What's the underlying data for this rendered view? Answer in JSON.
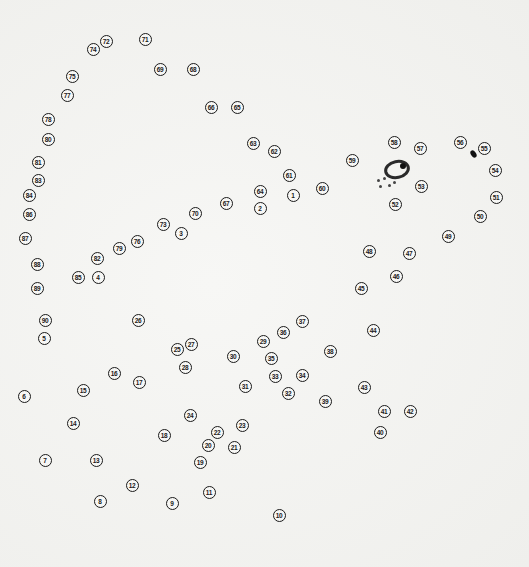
{
  "puzzle": {
    "type": "dot-to-dot",
    "dot_count": 90,
    "line_color": "#1a1a1a",
    "dots": [
      {
        "n": "1",
        "x": 293,
        "y": 195
      },
      {
        "n": "2",
        "x": 260,
        "y": 208
      },
      {
        "n": "3",
        "x": 181,
        "y": 233
      },
      {
        "n": "4",
        "x": 98,
        "y": 277
      },
      {
        "n": "5",
        "x": 44,
        "y": 338
      },
      {
        "n": "6",
        "x": 24,
        "y": 396
      },
      {
        "n": "7",
        "x": 45,
        "y": 460
      },
      {
        "n": "8",
        "x": 100,
        "y": 501
      },
      {
        "n": "9",
        "x": 172,
        "y": 503
      },
      {
        "n": "10",
        "x": 279,
        "y": 515
      },
      {
        "n": "11",
        "x": 209,
        "y": 492
      },
      {
        "n": "12",
        "x": 132,
        "y": 485
      },
      {
        "n": "13",
        "x": 96,
        "y": 460
      },
      {
        "n": "14",
        "x": 73,
        "y": 423
      },
      {
        "n": "15",
        "x": 83,
        "y": 390
      },
      {
        "n": "16",
        "x": 114,
        "y": 373
      },
      {
        "n": "17",
        "x": 139,
        "y": 382
      },
      {
        "n": "18",
        "x": 164,
        "y": 435
      },
      {
        "n": "19",
        "x": 200,
        "y": 462
      },
      {
        "n": "20",
        "x": 208,
        "y": 445
      },
      {
        "n": "21",
        "x": 234,
        "y": 447
      },
      {
        "n": "22",
        "x": 217,
        "y": 432
      },
      {
        "n": "23",
        "x": 242,
        "y": 425
      },
      {
        "n": "24",
        "x": 190,
        "y": 415
      },
      {
        "n": "25",
        "x": 177,
        "y": 349
      },
      {
        "n": "26",
        "x": 138,
        "y": 320
      },
      {
        "n": "27",
        "x": 191,
        "y": 344
      },
      {
        "n": "28",
        "x": 185,
        "y": 367
      },
      {
        "n": "29",
        "x": 263,
        "y": 341
      },
      {
        "n": "30",
        "x": 233,
        "y": 356
      },
      {
        "n": "31",
        "x": 245,
        "y": 386
      },
      {
        "n": "32",
        "x": 288,
        "y": 393
      },
      {
        "n": "33",
        "x": 275,
        "y": 376
      },
      {
        "n": "34",
        "x": 302,
        "y": 375
      },
      {
        "n": "35",
        "x": 271,
        "y": 358
      },
      {
        "n": "36",
        "x": 283,
        "y": 332
      },
      {
        "n": "37",
        "x": 302,
        "y": 321
      },
      {
        "n": "38",
        "x": 330,
        "y": 351
      },
      {
        "n": "39",
        "x": 325,
        "y": 401
      },
      {
        "n": "40",
        "x": 380,
        "y": 432
      },
      {
        "n": "41",
        "x": 384,
        "y": 411
      },
      {
        "n": "42",
        "x": 410,
        "y": 411
      },
      {
        "n": "43",
        "x": 364,
        "y": 387
      },
      {
        "n": "44",
        "x": 373,
        "y": 330
      },
      {
        "n": "45",
        "x": 361,
        "y": 288
      },
      {
        "n": "46",
        "x": 396,
        "y": 276
      },
      {
        "n": "47",
        "x": 409,
        "y": 253
      },
      {
        "n": "48",
        "x": 369,
        "y": 251
      },
      {
        "n": "49",
        "x": 448,
        "y": 236
      },
      {
        "n": "50",
        "x": 480,
        "y": 216
      },
      {
        "n": "51",
        "x": 496,
        "y": 197
      },
      {
        "n": "52",
        "x": 395,
        "y": 204
      },
      {
        "n": "53",
        "x": 421,
        "y": 186
      },
      {
        "n": "54",
        "x": 495,
        "y": 170
      },
      {
        "n": "55",
        "x": 484,
        "y": 148
      },
      {
        "n": "56",
        "x": 460,
        "y": 142
      },
      {
        "n": "57",
        "x": 420,
        "y": 148
      },
      {
        "n": "58",
        "x": 394,
        "y": 142
      },
      {
        "n": "59",
        "x": 352,
        "y": 160
      },
      {
        "n": "60",
        "x": 322,
        "y": 188
      },
      {
        "n": "61",
        "x": 289,
        "y": 175
      },
      {
        "n": "62",
        "x": 274,
        "y": 151
      },
      {
        "n": "63",
        "x": 253,
        "y": 143
      },
      {
        "n": "64",
        "x": 260,
        "y": 191
      },
      {
        "n": "65",
        "x": 237,
        "y": 107
      },
      {
        "n": "66",
        "x": 211,
        "y": 107
      },
      {
        "n": "67",
        "x": 226,
        "y": 203
      },
      {
        "n": "68",
        "x": 193,
        "y": 69
      },
      {
        "n": "69",
        "x": 160,
        "y": 69
      },
      {
        "n": "70",
        "x": 195,
        "y": 213
      },
      {
        "n": "71",
        "x": 145,
        "y": 39
      },
      {
        "n": "72",
        "x": 106,
        "y": 41
      },
      {
        "n": "73",
        "x": 163,
        "y": 224
      },
      {
        "n": "74",
        "x": 93,
        "y": 49
      },
      {
        "n": "75",
        "x": 72,
        "y": 76
      },
      {
        "n": "76",
        "x": 137,
        "y": 241
      },
      {
        "n": "77",
        "x": 67,
        "y": 95
      },
      {
        "n": "78",
        "x": 48,
        "y": 119
      },
      {
        "n": "79",
        "x": 119,
        "y": 248
      },
      {
        "n": "80",
        "x": 48,
        "y": 139
      },
      {
        "n": "81",
        "x": 38,
        "y": 162
      },
      {
        "n": "82",
        "x": 97,
        "y": 258
      },
      {
        "n": "83",
        "x": 38,
        "y": 180
      },
      {
        "n": "84",
        "x": 29,
        "y": 195
      },
      {
        "n": "85",
        "x": 78,
        "y": 277
      },
      {
        "n": "86",
        "x": 29,
        "y": 214
      },
      {
        "n": "87",
        "x": 25,
        "y": 238
      },
      {
        "n": "88",
        "x": 37,
        "y": 264
      },
      {
        "n": "89",
        "x": 37,
        "y": 288
      },
      {
        "n": "90",
        "x": 45,
        "y": 320
      }
    ],
    "features": {
      "eye": {
        "x": 397,
        "y": 170
      },
      "nostril": {
        "x": 473,
        "y": 154
      },
      "specks": [
        {
          "x": 377,
          "y": 179
        },
        {
          "x": 383,
          "y": 177
        },
        {
          "x": 379,
          "y": 185
        },
        {
          "x": 388,
          "y": 184
        },
        {
          "x": 393,
          "y": 181
        }
      ]
    }
  }
}
